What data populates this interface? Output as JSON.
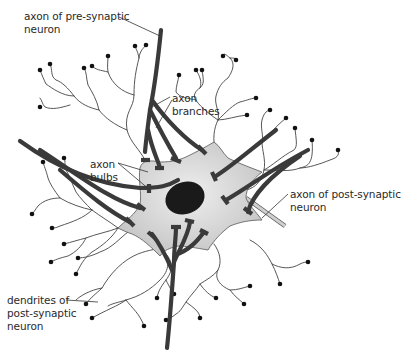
{
  "diagram": {
    "labels": {
      "pre_axon": "axon of pre-synaptic\nneuron",
      "axon_branches": "axon\nbranches",
      "axon_bulbs": "axon\nbulbs",
      "post_axon": "axon of post-synaptic\nneuron",
      "dendrites": "dendrites of\npost-synaptic\nneuron"
    },
    "colors": {
      "cell_body": "#d4d4d4",
      "nucleus": "#1a1a1a",
      "axon": "#3a3a3a",
      "dendrite": "#444444",
      "post_axon": "#c8c8c8",
      "text": "#2a2a2a"
    }
  }
}
